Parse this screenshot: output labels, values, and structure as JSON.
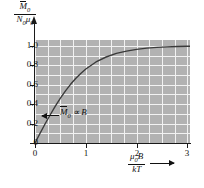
{
  "chart_data": {
    "type": "line",
    "title": "",
    "subtitle": "",
    "xlabel": "μ₀B / kT",
    "ylabel": "M̅₀ / N₀μ₀",
    "xlim": [
      0,
      3.05
    ],
    "ylim": [
      0,
      1.06
    ],
    "grid": true,
    "grid_x_step": 0.25,
    "grid_y_step": 0.1,
    "legend": "none",
    "x_ticks": [
      "0",
      "1",
      "2",
      "3"
    ],
    "x_tick_values": [
      0,
      1,
      2,
      3
    ],
    "y_ticks": [
      "0",
      "0.2",
      "0.4",
      "0.6",
      "0.8",
      "1.0"
    ],
    "y_tick_values": [
      0,
      0.2,
      0.4,
      0.6,
      0.8,
      1.0
    ],
    "series": [
      {
        "name": "Langevin saturation curve",
        "x": [
          0,
          0.1,
          0.2,
          0.3,
          0.4,
          0.5,
          0.6,
          0.7,
          0.8,
          0.9,
          1.0,
          1.2,
          1.4,
          1.6,
          1.8,
          2.0,
          2.2,
          2.4,
          2.6,
          2.8,
          3.0,
          3.05
        ],
        "y": [
          0,
          0.1,
          0.198,
          0.291,
          0.38,
          0.462,
          0.537,
          0.604,
          0.664,
          0.716,
          0.762,
          0.834,
          0.885,
          0.922,
          0.946,
          0.964,
          0.976,
          0.984,
          0.989,
          0.993,
          0.995,
          0.996
        ]
      }
    ],
    "annotations": [
      {
        "name": "linear-regime-label",
        "text": "M̅0 ∝ B",
        "text_parts": {
          "symbol": "M",
          "sub": "0",
          "relation": "∝",
          "field": "B"
        },
        "x": 0.45,
        "y": 0.22,
        "arrow": "points-left-to-curve"
      }
    ],
    "colors": {
      "plot_background": "#b2b2b2",
      "gridline": "#f2f2f2",
      "curve": "#3a3a3a",
      "axis": "#1a1a1a",
      "text": "#111111",
      "page_background": "#ffffff"
    }
  },
  "axes": {
    "y_title": {
      "numerator_symbol": "M",
      "numerator_sub": "0",
      "denominator": "N₀μ₀",
      "denominator_n": "N",
      "denominator_n_sub": "0",
      "denominator_mu": "μ",
      "denominator_mu_sub": "0"
    },
    "x_title": {
      "numerator_mu": "μ",
      "numerator_mu_sub": "0",
      "numerator_b": "B",
      "denominator": "kT"
    }
  }
}
